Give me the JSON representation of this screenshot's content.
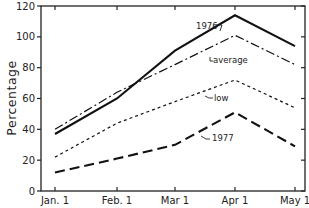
{
  "chart_data": {
    "type": "line",
    "title": "",
    "xlabel": "",
    "ylabel": "Percentage",
    "categories": [
      "Jan. 1",
      "Feb. 1",
      "Mar 1",
      "Apr 1",
      "May 1"
    ],
    "yticks": [
      0,
      20,
      40,
      60,
      80,
      100,
      120
    ],
    "ylim": [
      0,
      120
    ],
    "grid": false,
    "legend": "inline annotations",
    "series": [
      {
        "name": "1976",
        "style": "solid",
        "values": [
          37,
          60,
          91,
          114,
          94
        ]
      },
      {
        "name": "average",
        "style": "dash-dot",
        "values": [
          40,
          64,
          82,
          101,
          82
        ]
      },
      {
        "name": "low",
        "style": "short-dash",
        "values": [
          22,
          44,
          58,
          72,
          54
        ]
      },
      {
        "name": "1977",
        "style": "long-dash",
        "values": [
          12,
          21,
          30,
          51,
          29
        ]
      }
    ],
    "annotations": [
      {
        "text": "1976",
        "series": "1976"
      },
      {
        "text": "average",
        "series": "average"
      },
      {
        "text": "low",
        "series": "low"
      },
      {
        "text": "1977",
        "series": "1977"
      }
    ]
  }
}
